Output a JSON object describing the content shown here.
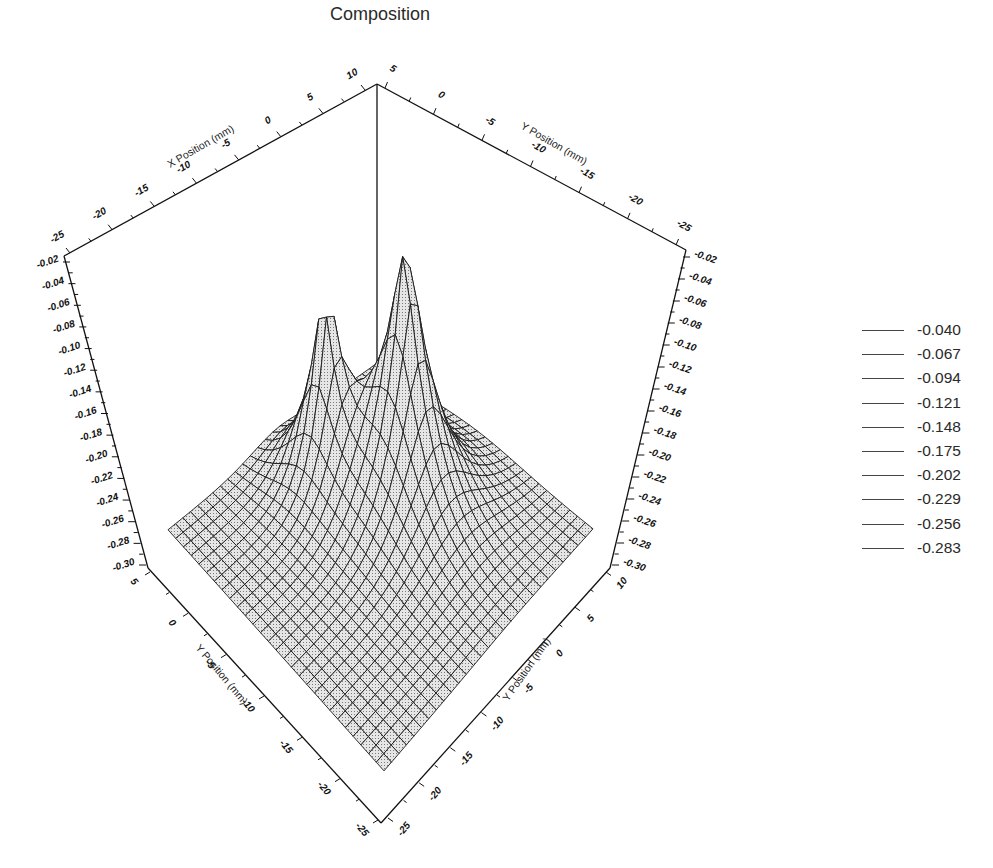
{
  "chart_data": {
    "type": "surface3d",
    "title": "Composition",
    "axes": {
      "top_left": {
        "label": "X Position (mm)",
        "ticks": [
          "-25",
          "-20",
          "-15",
          "-10",
          "-5",
          "0",
          "5",
          "10"
        ]
      },
      "top_right": {
        "label": "Y Position (mm)",
        "ticks": [
          "5",
          "0",
          "-5",
          "-10",
          "-15",
          "-20",
          "-25"
        ]
      },
      "bottom_left": {
        "label": "Y Position (mm)",
        "ticks": [
          "5",
          "0",
          "-5",
          "-10",
          "-15",
          "-20",
          "-25"
        ]
      },
      "bottom_right": {
        "label": "Y Position (mm)",
        "ticks": [
          "-25",
          "-20",
          "-15",
          "-10",
          "-5",
          "0",
          "5",
          "10"
        ]
      },
      "z_left": {
        "ticks": [
          "-0.02",
          "-0.04",
          "-0.06",
          "-0.08",
          "-0.10",
          "-0.12",
          "-0.14",
          "-0.16",
          "-0.18",
          "-0.20",
          "-0.22",
          "-0.24",
          "-0.26",
          "-0.28",
          "-0.30"
        ]
      },
      "z_right": {
        "ticks": [
          "-0.02",
          "-0.04",
          "-0.06",
          "-0.08",
          "-0.10",
          "-0.12",
          "-0.14",
          "-0.16",
          "-0.18",
          "-0.20",
          "-0.22",
          "-0.24",
          "-0.26",
          "-0.28",
          "-0.30"
        ]
      }
    },
    "x_range": [
      -25,
      10
    ],
    "y_range": [
      -25,
      5
    ],
    "z_range": [
      -0.3,
      -0.02
    ],
    "baseline_z": -0.28,
    "peaks": [
      {
        "name": "left-peak",
        "x": -7,
        "y": -2,
        "z_peak": -0.1,
        "sigma": 2.6
      },
      {
        "name": "right-peak",
        "x": -2,
        "y": -9,
        "z_peak": -0.03,
        "sigma": 4.0
      }
    ],
    "legend": {
      "position": "right",
      "contour_levels": [
        "-0.040",
        "-0.067",
        "-0.094",
        "-0.121",
        "-0.148",
        "-0.175",
        "-0.202",
        "-0.229",
        "-0.256",
        "-0.283"
      ]
    },
    "grid": true
  }
}
